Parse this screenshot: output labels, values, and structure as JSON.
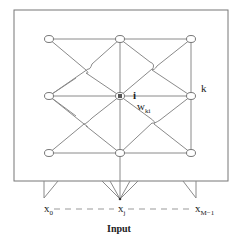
{
  "diagram": {
    "type": "self-organizing-map-lattice",
    "grid": {
      "rows": 3,
      "cols": 3
    },
    "labels": {
      "neuron_i": "i",
      "neuron_k": "k",
      "weight": "w",
      "weight_sub": "ki"
    },
    "inputs": {
      "first": "x",
      "first_sub": "0",
      "middle": "x",
      "middle_sub": "j",
      "last": "x",
      "last_sub": "M−1",
      "caption": "Input"
    },
    "colors": {
      "line": "#8a8a8a",
      "box": "#777777",
      "text": "#222222"
    }
  }
}
